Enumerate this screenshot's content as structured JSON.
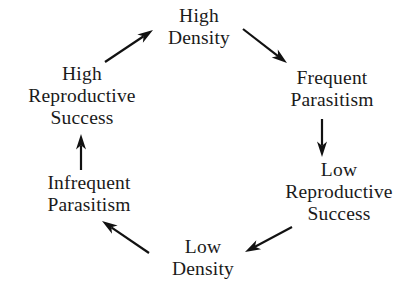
{
  "diagram": {
    "background_color": "#ffffff",
    "text_color": "#1a1a1a",
    "arrow_color": "#111111",
    "type": "cycle",
    "nodes": [
      {
        "id": "high-density",
        "label": "High\nDensity",
        "cx": 199,
        "cy": 27,
        "position": "top"
      },
      {
        "id": "frequent-parasitism",
        "label": "Frequent\nParasitism",
        "cx": 332,
        "cy": 89,
        "position": "top-right"
      },
      {
        "id": "low-reproductive-success",
        "label": "Low\nReproductive\nSuccess",
        "cx": 339,
        "cy": 192,
        "position": "right"
      },
      {
        "id": "low-density",
        "label": "Low\nDensity",
        "cx": 203,
        "cy": 258,
        "position": "bottom"
      },
      {
        "id": "infrequent-parasitism",
        "label": "Infrequent\nParasitism",
        "cx": 89,
        "cy": 194,
        "position": "bottom-left"
      },
      {
        "id": "high-reproductive-success",
        "label": "High\nReproductive\nSuccess",
        "cx": 82,
        "cy": 96,
        "position": "left"
      }
    ],
    "arrows": [
      {
        "id": "arrow-high-density-to-frequent-parasitism",
        "from": "high-density",
        "to": "frequent-parasitism",
        "x1": 243,
        "y1": 29,
        "x2": 287,
        "y2": 63
      },
      {
        "id": "arrow-frequent-parasitism-to-low-reproductive-success",
        "from": "frequent-parasitism",
        "to": "low-reproductive-success",
        "x1": 322,
        "y1": 119,
        "x2": 322,
        "y2": 157
      },
      {
        "id": "arrow-low-reproductive-success-to-low-density",
        "from": "low-reproductive-success",
        "to": "low-density",
        "x1": 292,
        "y1": 227,
        "x2": 245,
        "y2": 252
      },
      {
        "id": "arrow-low-density-to-infrequent-parasitism",
        "from": "low-density",
        "to": "infrequent-parasitism",
        "x1": 149,
        "y1": 253,
        "x2": 102,
        "y2": 221
      },
      {
        "id": "arrow-infrequent-parasitism-to-high-reproductive-success",
        "from": "infrequent-parasitism",
        "to": "high-reproductive-success",
        "x1": 81,
        "y1": 170,
        "x2": 81,
        "y2": 134
      },
      {
        "id": "arrow-high-reproductive-success-to-high-density",
        "from": "high-reproductive-success",
        "to": "high-density",
        "x1": 105,
        "y1": 62,
        "x2": 153,
        "y2": 30
      }
    ]
  }
}
